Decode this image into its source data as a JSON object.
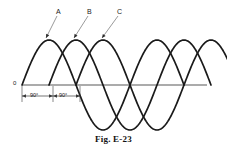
{
  "figure": {
    "caption": "Fig. E-23",
    "origin_label": "0",
    "axis_color": "#8f8f8f",
    "curve_color": "#1a1a1a",
    "background": "#ffffff"
  },
  "curve_labels": [
    {
      "text": "A",
      "x": 58,
      "y": 11,
      "anchor_x": 44,
      "anchor_y": 40
    },
    {
      "text": "B",
      "x": 89,
      "y": 11,
      "anchor_x": 72,
      "anchor_y": 40
    },
    {
      "text": "C",
      "x": 119,
      "y": 11,
      "anchor_x": 100,
      "anchor_y": 40
    }
  ],
  "dimensions": [
    {
      "text": "90°",
      "x1": 22,
      "x2": 53,
      "y": 96
    },
    {
      "text": "90°",
      "x1": 53,
      "x2": 80,
      "y": 96
    }
  ],
  "chart_data": {
    "type": "line",
    "title": "Fig. E-23",
    "xlabel": "",
    "ylabel": "",
    "grid": false,
    "legend": "inline-callouts",
    "x_unit": "degrees",
    "x_range_deg": [
      0,
      630
    ],
    "amplitude": 1,
    "period_deg": 360,
    "phase_step_deg": 90,
    "series": [
      {
        "name": "A",
        "phase_deg": 0,
        "start_deg": 0,
        "end_deg": 540,
        "color": "#1a1a1a"
      },
      {
        "name": "B",
        "phase_deg": -90,
        "start_deg": 90,
        "end_deg": 630,
        "color": "#1a1a1a"
      },
      {
        "name": "C",
        "phase_deg": -180,
        "start_deg": 180,
        "end_deg": 720,
        "color": "#1a1a1a"
      }
    ],
    "annotations": [
      "0",
      "90°",
      "90°",
      "A",
      "B",
      "C"
    ]
  }
}
